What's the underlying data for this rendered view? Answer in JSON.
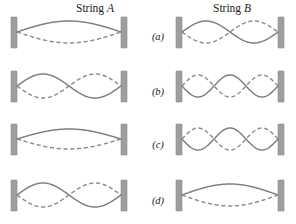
{
  "figure": {
    "width": 296,
    "height": 224,
    "background": "#ffffff",
    "wall_color": "#9e9e9e",
    "solid_wave_color": "#7d7d7d",
    "dashed_wave_color": "#8d8d8d",
    "label_color": "#1a1a1a"
  },
  "headings": [
    {
      "name": "string-a-heading",
      "prefix": "String ",
      "variable": "A",
      "text": "String A",
      "x": 95,
      "y": 12
    },
    {
      "name": "string-b-heading",
      "prefix": "String ",
      "variable": "B",
      "text": "String B",
      "x": 232,
      "y": 12
    }
  ],
  "row_labels": [
    {
      "text": "(a)",
      "x": 158,
      "y": 40
    },
    {
      "text": "(b)",
      "x": 158,
      "y": 95
    },
    {
      "text": "(c)",
      "x": 158,
      "y": 148
    },
    {
      "text": "(d)",
      "x": 158,
      "y": 204
    }
  ],
  "columns": [
    {
      "id": "A",
      "label": "String A",
      "wall_left_x": 11,
      "wall_right_x": 121,
      "wall_width": 6
    },
    {
      "id": "B",
      "label": "String B",
      "wall_left_x": 176,
      "wall_right_x": 278,
      "wall_width": 6
    }
  ],
  "rows": [
    {
      "id": "a",
      "label": "(a)",
      "center_y": 32,
      "wall_top": 17,
      "wall_height": 31
    },
    {
      "id": "b",
      "label": "(b)",
      "center_y": 86,
      "wall_top": 71,
      "wall_height": 31
    },
    {
      "id": "c",
      "label": "(c)",
      "center_y": 139,
      "wall_top": 124,
      "wall_height": 31
    },
    {
      "id": "d",
      "label": "(d)",
      "center_y": 195,
      "wall_top": 180,
      "wall_height": 31
    }
  ],
  "chart_data": {
    "type": "line",
    "xlabel": "",
    "ylabel": "",
    "panels": [
      {
        "row": "(a)",
        "string": "String A",
        "harmonic": 1,
        "loops": 1,
        "amplitude_px": 11,
        "first_loop_solid_on_top": true
      },
      {
        "row": "(a)",
        "string": "String B",
        "harmonic": 2,
        "loops": 2,
        "amplitude_px": 11,
        "first_loop_solid_on_top": true
      },
      {
        "row": "(b)",
        "string": "String A",
        "harmonic": 2,
        "loops": 2,
        "amplitude_px": 12,
        "first_loop_solid_on_top": true
      },
      {
        "row": "(b)",
        "string": "String B",
        "harmonic": 3,
        "loops": 3,
        "amplitude_px": 11,
        "first_loop_solid_on_top": false
      },
      {
        "row": "(c)",
        "string": "String A",
        "harmonic": 1,
        "loops": 1,
        "amplitude_px": 10,
        "first_loop_solid_on_top": true
      },
      {
        "row": "(c)",
        "string": "String B",
        "harmonic": 3,
        "loops": 3,
        "amplitude_px": 11,
        "first_loop_solid_on_top": false
      },
      {
        "row": "(d)",
        "string": "String A",
        "harmonic": 2,
        "loops": 2,
        "amplitude_px": 12,
        "first_loop_solid_on_top": true
      },
      {
        "row": "(d)",
        "string": "String B",
        "harmonic": 1,
        "loops": 1,
        "amplitude_px": 11,
        "first_loop_solid_on_top": true
      }
    ],
    "legend": [
      {
        "name": "solid-curve",
        "label": "String displacement at one instant",
        "style": "solid",
        "color": "#7d7d7d"
      },
      {
        "name": "dashed-curve",
        "label": "String displacement half a period later",
        "style": "dashed",
        "color": "#8d8d8d"
      }
    ]
  }
}
